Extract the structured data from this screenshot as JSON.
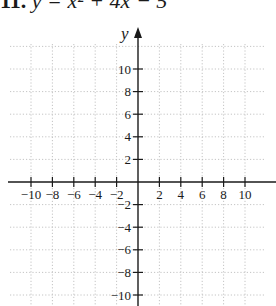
{
  "problem": {
    "number": "11.",
    "equation": "y = x² + 4x − 5"
  },
  "chart_data": {
    "type": "line",
    "title": "",
    "xlabel": "",
    "ylabel": "y",
    "xlim": [
      -10,
      10
    ],
    "ylim": [
      -10,
      10
    ],
    "grid": true,
    "grid_style": "dotted",
    "grid_step": 2,
    "x_ticks": [
      -10,
      -8,
      -6,
      -4,
      -2,
      2,
      4,
      6,
      8,
      10
    ],
    "y_ticks": [
      -10,
      -8,
      -6,
      -4,
      -2,
      2,
      4,
      6,
      8,
      10
    ],
    "x_tick_labels": [
      "−10",
      "−8",
      "−6",
      "−4",
      "−2",
      "2",
      "4",
      "6",
      "8",
      "10"
    ],
    "y_tick_labels": [
      "−10",
      "−8",
      "−6",
      "−4",
      "−2",
      "2",
      "4",
      "6",
      "8",
      "10"
    ],
    "series": []
  }
}
